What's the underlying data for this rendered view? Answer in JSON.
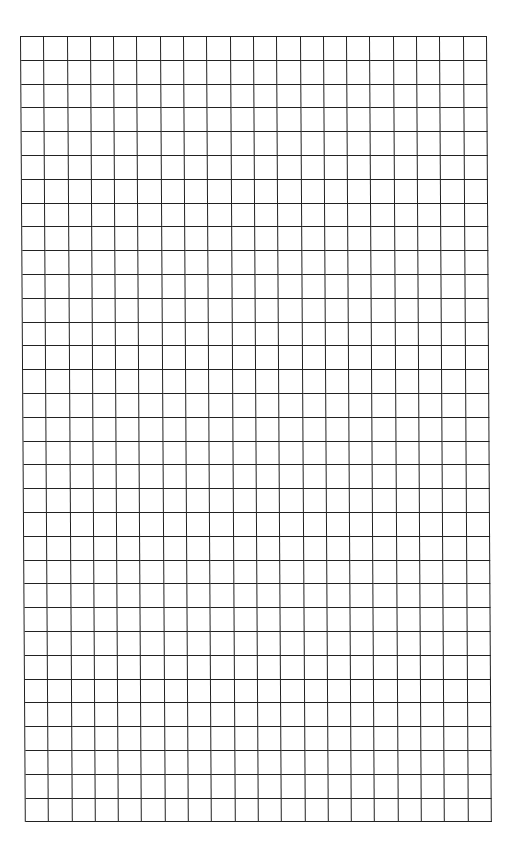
{
  "page": {
    "type": "grid-paper",
    "background_color": "#ffffff",
    "line_color": "#222222"
  },
  "grid": {
    "columns": 20,
    "rows": 33,
    "cell_width": 23.3,
    "cell_height": 23.8
  }
}
